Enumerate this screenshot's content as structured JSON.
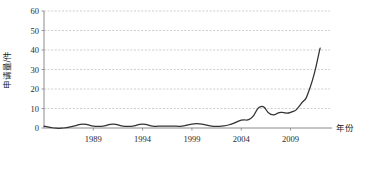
{
  "chart_data": {
    "type": "line",
    "title": "",
    "xlabel": "年份",
    "ylabel": "申请量/件",
    "xlim": [
      1984,
      2013
    ],
    "ylim": [
      0,
      60
    ],
    "ytick_values": [
      0,
      10,
      20,
      30,
      40,
      50,
      60
    ],
    "ytick_labels": [
      "0",
      "10",
      "20",
      "30",
      "40",
      "50",
      "60"
    ],
    "xtick_values": [
      1989,
      1994,
      1999,
      2004,
      2009
    ],
    "xtick_labels": [
      "1989",
      "1994",
      "1999",
      "2004",
      "2009"
    ],
    "grid": "horizontal-dashed",
    "legend": "none",
    "series": [
      {
        "name": "申请量",
        "color": "#333333",
        "x": [
          1984,
          1985,
          1986,
          1987,
          1988,
          1989,
          1990,
          1991,
          1992,
          1993,
          1994,
          1995,
          1996,
          1997,
          1998,
          1999,
          2000,
          2001,
          2002,
          2003,
          2004,
          2005,
          2006,
          2007,
          2008,
          2009,
          2010,
          2011,
          2012
        ],
        "values": [
          1,
          0,
          0,
          1,
          2,
          1,
          1,
          2,
          1,
          1,
          2,
          1,
          1,
          1,
          1,
          2,
          2,
          1,
          1,
          2,
          4,
          5,
          11,
          7,
          8,
          8,
          12,
          21,
          41
        ]
      }
    ]
  },
  "axis_labels": {
    "y_axis_title": "申请量/件",
    "x_axis_title": "年份"
  },
  "style": {
    "line_color": "#333333",
    "grid_color": "#b9b9b9",
    "axis_color": "#808080",
    "text_color": "#2b2b2b"
  }
}
